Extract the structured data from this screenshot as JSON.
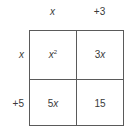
{
  "diagram": {
    "type": "area-model-multiplication",
    "colors": {
      "line": "#5a5a5a",
      "text": "#3a3a3a",
      "background": "#ffffff"
    },
    "column_headers": [
      {
        "coef": "",
        "var": "x",
        "text": "x"
      },
      {
        "coef": "+3",
        "var": "",
        "text": "+3"
      }
    ],
    "row_headers": [
      {
        "coef": "",
        "var": "x",
        "text": "x"
      },
      {
        "coef": "+5",
        "var": "",
        "text": "+5"
      }
    ],
    "cells": [
      [
        {
          "coef": "",
          "var": "x",
          "exp": "2",
          "text": "x²"
        },
        {
          "coef": "3",
          "var": "x",
          "exp": "",
          "text": "3x"
        }
      ],
      [
        {
          "coef": "5",
          "var": "x",
          "exp": "",
          "text": "5x"
        },
        {
          "coef": "15",
          "var": "",
          "exp": "",
          "text": "15"
        }
      ]
    ]
  }
}
